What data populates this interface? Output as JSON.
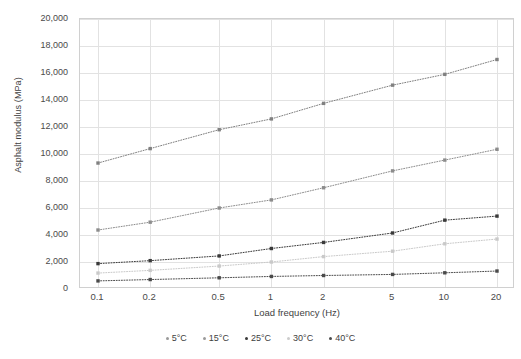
{
  "chart_data": {
    "type": "line",
    "title": "",
    "xlabel": "Load frequency (Hz)",
    "ylabel": "Asphalt modulus (MPa)",
    "x_scale": "log",
    "categories": [
      "0.1",
      "0.2",
      "0.5",
      "1",
      "2",
      "5",
      "10",
      "20"
    ],
    "x_values": [
      0.1,
      0.2,
      0.5,
      1,
      2,
      5,
      10,
      20
    ],
    "ylim": [
      0,
      20000
    ],
    "y_ticks": [
      "0",
      "2,000",
      "4,000",
      "6,000",
      "8,000",
      "10,000",
      "12,000",
      "14,000",
      "16,000",
      "18,000",
      "20,000"
    ],
    "y_tick_values": [
      0,
      2000,
      4000,
      6000,
      8000,
      10000,
      12000,
      14000,
      16000,
      18000,
      20000
    ],
    "grid": true,
    "legend_position": "bottom",
    "marker_style": "square-dot",
    "line_style": "dotted",
    "series": [
      {
        "name": "5°C",
        "color": "#808080",
        "values": [
          9330,
          10400,
          11800,
          12600,
          13750,
          15100,
          15900,
          17000
        ]
      },
      {
        "name": "15°C",
        "color": "#8c8c8c",
        "values": [
          4370,
          4950,
          6000,
          6600,
          7500,
          8750,
          9550,
          10350
        ]
      },
      {
        "name": "25°C",
        "color": "#3a3a3a",
        "values": [
          1880,
          2100,
          2450,
          3000,
          3450,
          4150,
          5100,
          5400
        ]
      },
      {
        "name": "30°C",
        "color": "#c9c9c9",
        "values": [
          1180,
          1380,
          1700,
          2000,
          2400,
          2800,
          3350,
          3700
        ]
      },
      {
        "name": "40°C",
        "color": "#4a4a4a",
        "values": [
          600,
          700,
          830,
          930,
          1000,
          1080,
          1200,
          1330
        ]
      }
    ]
  },
  "legend": {
    "items": [
      {
        "label": "5°C",
        "color": "#9a9a9a"
      },
      {
        "label": "15°C",
        "color": "#9a9a9a"
      },
      {
        "label": "25°C",
        "color": "#3a3a3a"
      },
      {
        "label": "30°C",
        "color": "#cccccc"
      },
      {
        "label": "40°C",
        "color": "#4a4a4a"
      }
    ]
  },
  "colors": {
    "grid": "#e2e2e2",
    "axis_border": "#d0d0d0",
    "text": "#3f3f3f",
    "background": "#ffffff"
  }
}
